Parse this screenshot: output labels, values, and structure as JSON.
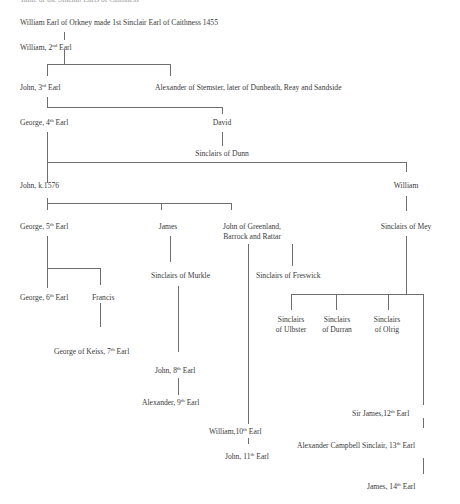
{
  "diagram": {
    "type": "family-tree",
    "title_partial": "Table of the Sinclair Earls of Caithness",
    "line_color": "#6e6e6e",
    "text_color": "#3a3a3a",
    "nodes": {
      "william_1st": {
        "text": "William Earl of Orkney made 1st Sinclair Earl of Caithness 1455"
      },
      "william_2nd": {
        "pre": "William, 2",
        "sup": "nd",
        "post": " Earl"
      },
      "john_3rd": {
        "pre": "John, 3",
        "sup": "rd",
        "post": " Earl"
      },
      "alexander_stemster": {
        "text": "Alexander of Stemster, later of Dunbeath, Reay and Sandside"
      },
      "george_4th": {
        "pre": "George, 4",
        "sup": "th",
        "post": " Earl"
      },
      "david": {
        "text": "David"
      },
      "sinclairs_dunn": {
        "text": "Sinclairs of Dunn"
      },
      "john_k1576": {
        "text": "John, k.1576"
      },
      "william_mey": {
        "text": "William"
      },
      "george_5th": {
        "pre": "George, 5",
        "sup": "th",
        "post": " Earl"
      },
      "james": {
        "text": "James"
      },
      "john_greenland": {
        "line1": "John of Greenland,",
        "line2": "Barrock and Rattar"
      },
      "sinclairs_mey": {
        "text": "Sinclairs of Mey"
      },
      "sinclairs_murkle": {
        "text": "Sinclairs of Murkle"
      },
      "sinclairs_freswick": {
        "text": "Sinclairs of Freswick"
      },
      "george_6th": {
        "pre": "George, 6",
        "sup": "th",
        "post": " Earl"
      },
      "francis": {
        "text": "Francis"
      },
      "sinclairs_ulbster": {
        "line1": "Sinclairs",
        "line2": "of Ulbster"
      },
      "sinclairs_durran": {
        "line1": "Sinclairs",
        "line2": "of Durran"
      },
      "sinclairs_olrig": {
        "line1": "Sinclairs",
        "line2": "of Olrig"
      },
      "george_keiss_7th": {
        "pre": "George of Keiss, 7",
        "sup": "th",
        "post": " Earl"
      },
      "john_8th": {
        "pre": "John, 8",
        "sup": "th",
        "post": " Earl"
      },
      "alexander_9th": {
        "pre": "Alexander, 9",
        "sup": "th",
        "post": " Earl"
      },
      "william_10th": {
        "pre": "William,10",
        "sup": "th",
        "post": " Earl"
      },
      "john_11th": {
        "pre": "John, 11",
        "sup": "th",
        "post": " Earl"
      },
      "sir_james_12th": {
        "pre": "Sir James,12",
        "sup": "th",
        "post": " Earl"
      },
      "alexander_13th": {
        "pre": "Alexander Campbell Sinclair, 13",
        "sup": "th",
        "post": " Earl"
      },
      "james_14th": {
        "pre": "James, 14",
        "sup": "th",
        "post": " Earl"
      }
    }
  }
}
